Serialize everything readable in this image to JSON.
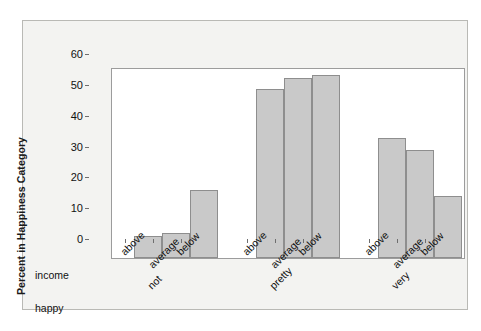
{
  "chart_data": {
    "type": "bar",
    "title": "",
    "xlabel": "",
    "ylabel": "Percent in Happiness Category",
    "ylim": [
      0,
      62
    ],
    "yticks": [
      0,
      10,
      20,
      30,
      40,
      50,
      60
    ],
    "grid": false,
    "legend": null,
    "row_headers": {
      "income": "income",
      "happy": "happy"
    },
    "categories": [
      "above",
      "average",
      "below"
    ],
    "groups": [
      {
        "label": "not",
        "bars": [
          {
            "category": "above",
            "value": 7
          },
          {
            "category": "average",
            "value": 8
          },
          {
            "category": "below",
            "value": 22
          }
        ]
      },
      {
        "label": "pretty",
        "bars": [
          {
            "category": "above",
            "value": 55
          },
          {
            "category": "average",
            "value": 58.5
          },
          {
            "category": "below",
            "value": 59.5
          }
        ]
      },
      {
        "label": "very",
        "bars": [
          {
            "category": "above",
            "value": 39
          },
          {
            "category": "average",
            "value": 35
          },
          {
            "category": "below",
            "value": 20
          }
        ]
      }
    ],
    "colors": {
      "bar_fill": "#c9c9c9",
      "bar_edge": "#8e8e8e",
      "panel_background": "#ffffff",
      "figure_background": "#f3f3f1",
      "text": "#111111"
    }
  }
}
